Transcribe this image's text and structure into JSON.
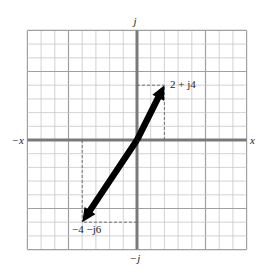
{
  "diagram": {
    "type": "complex-plane",
    "units_per_cell": 1,
    "range": {
      "x": [
        -8,
        8
      ],
      "y": [
        -8,
        8
      ]
    },
    "major_line_every": 5,
    "axes": {
      "positive_real": "x",
      "negative_real": "−x",
      "positive_imag": "j",
      "negative_imag": "−j"
    },
    "vectors": [
      {
        "from": [
          0,
          0
        ],
        "to": [
          2,
          4
        ],
        "label": "2 + j4"
      },
      {
        "from": [
          0,
          0
        ],
        "to": [
          -4,
          -6
        ],
        "label": "−4 −j6"
      }
    ],
    "colors": {
      "grid_minor": "#c8c8c8",
      "grid_major": "#a0a0a0",
      "axis": "#7a7a7a",
      "vector": "#000000",
      "projection": "#666666"
    }
  }
}
